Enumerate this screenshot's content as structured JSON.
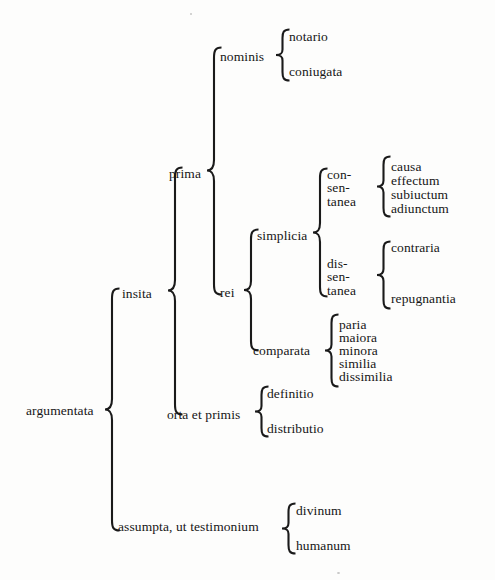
{
  "diagram": {
    "type": "bracket-tree",
    "title_text": "",
    "root": "argumentata",
    "ink_color": "#161616",
    "background_color": "#fdfdfc",
    "nodes": {
      "argumentata": "argumentata",
      "insita": "insita",
      "assumpta": "assumpta, ut testimonium",
      "prima": "prima",
      "orta_et_primis": "orta et primis",
      "nominis": "nominis",
      "rei": "rei",
      "notario": "notario",
      "coniugata": "coniugata",
      "simplicia": "simplicia",
      "comparata": "comparata",
      "consentanea_l1": "con-",
      "consentanea_l2": "sen-",
      "consentanea_l3": "tanea",
      "dissentanea_l1": "dis-",
      "dissentanea_l2": "sen-",
      "dissentanea_l3": "tanea",
      "causa": "causa",
      "effectum": "effectum",
      "subiuctum": "subiuctum",
      "adiunctum": "adiunctum",
      "contraria": "contraria",
      "repugnantia": "repugnantia",
      "paria": "paria",
      "maiora": "maiora",
      "minora": "minora",
      "similia": "similia",
      "dissimilia": "dissimilia",
      "definitio": "definitio",
      "distributio": "distributio",
      "divinum": "divinum",
      "humanum": "humanum"
    },
    "branches": {
      "argumentata": [
        "insita",
        "assumpta, ut testimonium"
      ],
      "insita": [
        "prima",
        "orta et primis"
      ],
      "prima": [
        "nominis",
        "rei"
      ],
      "nominis": [
        "notario",
        "coniugata"
      ],
      "rei": [
        "simplicia",
        "comparata"
      ],
      "simplicia": [
        "con-sen-tanea",
        "dis-sen-tanea"
      ],
      "con-sen-tanea": [
        "causa",
        "effectum",
        "subiuctum",
        "adiunctum"
      ],
      "dis-sen-tanea": [
        "contraria",
        "repugnantia"
      ],
      "comparata": [
        "paria",
        "maiora",
        "minora",
        "similia",
        "dissimilia"
      ],
      "orta et primis": [
        "definitio",
        "distributio"
      ],
      "assumpta, ut testimonium": [
        "divinum",
        "humanum"
      ]
    }
  }
}
